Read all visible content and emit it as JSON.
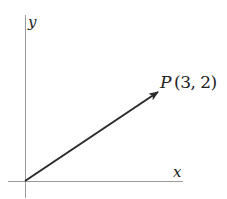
{
  "diagram": {
    "axes": {
      "x_label": "x",
      "y_label": "y"
    },
    "vector": {
      "from": [
        0,
        0
      ],
      "to": [
        3,
        2
      ]
    },
    "point_label": {
      "name": "P",
      "coords": "(3, 2)"
    },
    "colors": {
      "axis": "#9a9a9a",
      "vector": "#2a2a2a",
      "text": "#222222"
    }
  }
}
